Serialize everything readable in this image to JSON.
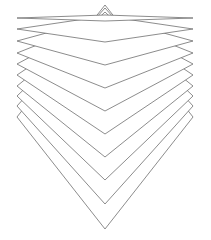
{
  "diagram": {
    "title": "",
    "stroke_color": "#6e6e6e",
    "fill_color": "#ffffff",
    "background": "#ffffff",
    "left_x": 17,
    "right_x": 193,
    "center_x": 105,
    "layers": [
      {
        "left_y": 18,
        "bottom_y": 21
      },
      {
        "left_y": 29,
        "bottom_y": 42
      },
      {
        "left_y": 41,
        "bottom_y": 65
      },
      {
        "left_y": 53,
        "bottom_y": 88
      },
      {
        "left_y": 64,
        "bottom_y": 111
      },
      {
        "left_y": 75,
        "bottom_y": 134
      },
      {
        "left_y": 86,
        "bottom_y": 157
      },
      {
        "left_y": 96,
        "bottom_y": 180
      },
      {
        "left_y": 106,
        "bottom_y": 204
      },
      {
        "left_y": 117,
        "bottom_y": 229
      }
    ]
  }
}
